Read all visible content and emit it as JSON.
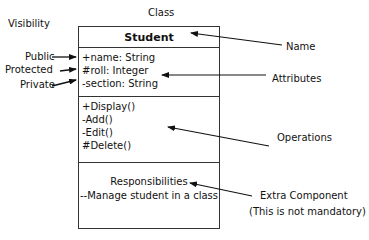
{
  "diagram": {
    "title_label": "Class",
    "visibility_label": "Visibility",
    "visibility": {
      "public": "Public",
      "protected": "Protected",
      "private": "Private"
    },
    "class": {
      "name": "Student",
      "attributes": [
        "+name: String",
        "#roll: Integer",
        "-section: String"
      ],
      "operations": [
        "+Display()",
        "-Add()",
        "-Edit()",
        "#Delete()"
      ],
      "responsibilities": {
        "heading": "Responsibilities",
        "text": "--Manage student in a class"
      }
    },
    "annotations": {
      "name": "Name",
      "attributes": "Attributes",
      "operations": "Operations",
      "extra_component": "Extra Component",
      "extra_component_note": "(This is not mandatory)"
    },
    "colors": {
      "line": "#111111",
      "border": "#333333",
      "background": "#ffffff"
    }
  }
}
